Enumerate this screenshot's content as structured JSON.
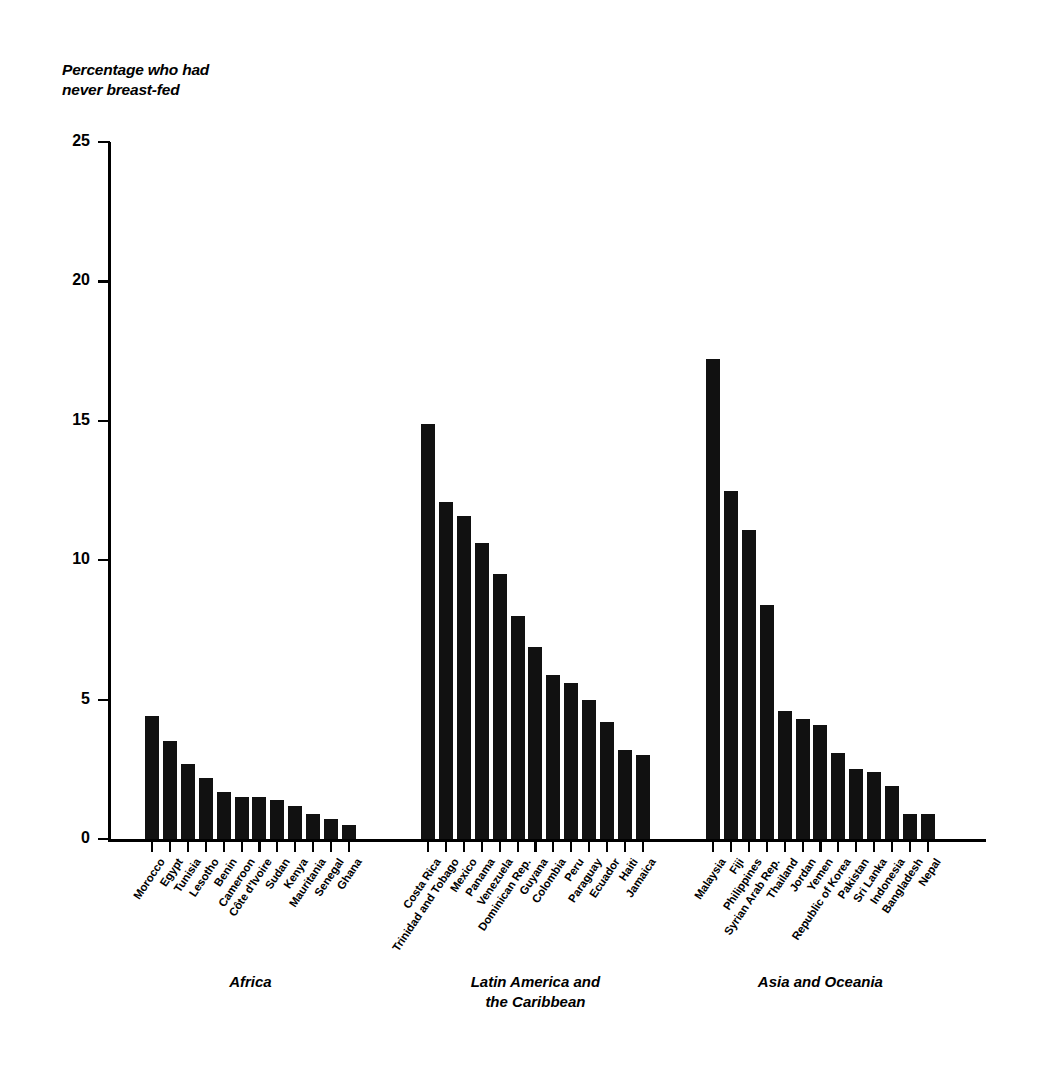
{
  "chart_data": {
    "type": "bar",
    "title": "Percentage who had\nnever breast-fed",
    "xlabel": "",
    "ylabel": "",
    "ylim": [
      0,
      25
    ],
    "yticks": [
      0,
      5,
      10,
      15,
      20,
      25
    ],
    "grid": false,
    "legend": null,
    "orientation": "vertical",
    "bar_color": "#111111",
    "groups": [
      {
        "name": "Africa",
        "caption": "Africa",
        "categories": [
          "Morocco",
          "Egypt",
          "Tunisia",
          "Lesotho",
          "Benin",
          "Cameroon",
          "Côte d'Ivoire",
          "Sudan",
          "Kenya",
          "Mauritania",
          "Senegal",
          "Ghana"
        ],
        "values": [
          4.4,
          3.5,
          2.7,
          2.2,
          1.7,
          1.5,
          1.5,
          1.4,
          1.2,
          0.9,
          0.7,
          0.5
        ]
      },
      {
        "name": "Latin America and the Caribbean",
        "caption": "Latin America and\nthe Caribbean",
        "categories": [
          "Costa Rica",
          "Trinidad and Tobago",
          "Mexico",
          "Panama",
          "Venezuela",
          "Dominican Rep.",
          "Guyana",
          "Colombia",
          "Peru",
          "Paraguay",
          "Ecuador",
          "Haiti",
          "Jamaica"
        ],
        "values": [
          14.9,
          12.1,
          11.6,
          10.6,
          9.5,
          8.0,
          6.9,
          5.9,
          5.6,
          5.0,
          4.2,
          3.2,
          3.0
        ]
      },
      {
        "name": "Asia and Oceania",
        "caption": "Asia and Oceania",
        "categories": [
          "Malaysia",
          "Fiji",
          "Philippines",
          "Syrian Arab Rep.",
          "Thailand",
          "Jordan",
          "Yemen",
          "Republic of Korea",
          "Pakistan",
          "Sri Lanka",
          "Indonesia",
          "Bangladesh",
          "Nepal"
        ],
        "values": [
          17.2,
          12.5,
          11.1,
          8.4,
          4.6,
          4.3,
          4.1,
          3.1,
          2.5,
          2.4,
          1.9,
          0.9,
          0.9
        ]
      }
    ]
  }
}
